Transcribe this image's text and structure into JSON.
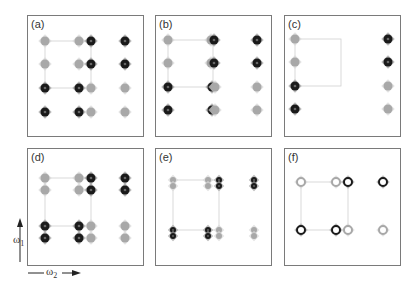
{
  "figure": {
    "panels": [
      {
        "id": "a",
        "label": "(a)",
        "box": [
          27,
          15,
          117,
          122
        ],
        "rect": [
          45,
          41,
          91,
          88
        ],
        "peaks": [
          {
            "x": 45,
            "y": 41,
            "t": "light"
          },
          {
            "x": 79,
            "y": 41,
            "t": "light"
          },
          {
            "x": 91,
            "y": 41,
            "t": "dark"
          },
          {
            "x": 125,
            "y": 41,
            "t": "dark"
          },
          {
            "x": 45,
            "y": 64,
            "t": "light"
          },
          {
            "x": 79,
            "y": 64,
            "t": "light"
          },
          {
            "x": 91,
            "y": 64,
            "t": "dark"
          },
          {
            "x": 125,
            "y": 64,
            "t": "dark"
          },
          {
            "x": 45,
            "y": 88,
            "t": "dark"
          },
          {
            "x": 79,
            "y": 88,
            "t": "dark"
          },
          {
            "x": 91,
            "y": 88,
            "t": "light"
          },
          {
            "x": 125,
            "y": 88,
            "t": "light"
          },
          {
            "x": 45,
            "y": 112,
            "t": "dark"
          },
          {
            "x": 79,
            "y": 112,
            "t": "dark"
          },
          {
            "x": 91,
            "y": 112,
            "t": "light"
          },
          {
            "x": 125,
            "y": 112,
            "t": "light"
          }
        ]
      },
      {
        "id": "b",
        "label": "(b)",
        "box": [
          155,
          15,
          117,
          122
        ],
        "rect": [
          168,
          40,
          213,
          87
        ],
        "peaks": [
          {
            "x": 168,
            "y": 40,
            "t": "light"
          },
          {
            "x": 211,
            "y": 40,
            "t": "light"
          },
          {
            "x": 214,
            "y": 40,
            "t": "dark"
          },
          {
            "x": 257,
            "y": 40,
            "t": "dark"
          },
          {
            "x": 168,
            "y": 63,
            "t": "light"
          },
          {
            "x": 211,
            "y": 63,
            "t": "light"
          },
          {
            "x": 214,
            "y": 63,
            "t": "dark"
          },
          {
            "x": 257,
            "y": 63,
            "t": "dark"
          },
          {
            "x": 168,
            "y": 87,
            "t": "dark"
          },
          {
            "x": 212,
            "y": 87,
            "t": "dark"
          },
          {
            "x": 215,
            "y": 87,
            "t": "light"
          },
          {
            "x": 257,
            "y": 87,
            "t": "light"
          },
          {
            "x": 168,
            "y": 110,
            "t": "dark"
          },
          {
            "x": 212,
            "y": 110,
            "t": "dark"
          },
          {
            "x": 215,
            "y": 110,
            "t": "light"
          },
          {
            "x": 257,
            "y": 110,
            "t": "light"
          }
        ]
      },
      {
        "id": "c",
        "label": "(c)",
        "box": [
          284,
          15,
          117,
          122
        ],
        "rect": [
          295,
          39,
          341,
          86
        ],
        "peaks": [
          {
            "x": 295,
            "y": 39,
            "t": "light"
          },
          {
            "x": 388,
            "y": 39,
            "t": "dark"
          },
          {
            "x": 295,
            "y": 62,
            "t": "light"
          },
          {
            "x": 388,
            "y": 62,
            "t": "dark"
          },
          {
            "x": 295,
            "y": 86,
            "t": "dark"
          },
          {
            "x": 388,
            "y": 86,
            "t": "light"
          },
          {
            "x": 295,
            "y": 109,
            "t": "dark"
          },
          {
            "x": 388,
            "y": 109,
            "t": "light"
          }
        ]
      },
      {
        "id": "d",
        "label": "(d)",
        "box": [
          27,
          148,
          117,
          118
        ],
        "rect": [
          45,
          178,
          91,
          226
        ],
        "peaks": [
          {
            "x": 45,
            "y": 178,
            "t": "light"
          },
          {
            "x": 79,
            "y": 178,
            "t": "light"
          },
          {
            "x": 91,
            "y": 178,
            "t": "dark"
          },
          {
            "x": 125,
            "y": 178,
            "t": "dark"
          },
          {
            "x": 45,
            "y": 190,
            "t": "light"
          },
          {
            "x": 79,
            "y": 190,
            "t": "light"
          },
          {
            "x": 91,
            "y": 190,
            "t": "dark"
          },
          {
            "x": 125,
            "y": 190,
            "t": "dark"
          },
          {
            "x": 45,
            "y": 226,
            "t": "dark"
          },
          {
            "x": 79,
            "y": 226,
            "t": "dark"
          },
          {
            "x": 91,
            "y": 226,
            "t": "light"
          },
          {
            "x": 125,
            "y": 226,
            "t": "light"
          },
          {
            "x": 45,
            "y": 238,
            "t": "dark"
          },
          {
            "x": 79,
            "y": 238,
            "t": "dark"
          },
          {
            "x": 91,
            "y": 238,
            "t": "light"
          },
          {
            "x": 125,
            "y": 238,
            "t": "light"
          }
        ]
      },
      {
        "id": "e",
        "label": "(e)",
        "box": [
          155,
          148,
          117,
          118
        ],
        "rect": [
          173,
          180,
          219,
          230
        ],
        "peaks": [
          {
            "x": 173,
            "y": 180,
            "t": "light",
            "s": "small"
          },
          {
            "x": 173,
            "y": 186,
            "t": "light",
            "s": "small"
          },
          {
            "x": 208,
            "y": 180,
            "t": "light",
            "s": "small"
          },
          {
            "x": 208,
            "y": 186,
            "t": "light",
            "s": "small"
          },
          {
            "x": 219,
            "y": 180,
            "t": "dark",
            "s": "small"
          },
          {
            "x": 219,
            "y": 186,
            "t": "dark",
            "s": "small"
          },
          {
            "x": 254,
            "y": 180,
            "t": "dark",
            "s": "small"
          },
          {
            "x": 254,
            "y": 186,
            "t": "dark",
            "s": "small"
          },
          {
            "x": 173,
            "y": 230,
            "t": "dark",
            "s": "small"
          },
          {
            "x": 173,
            "y": 236,
            "t": "dark",
            "s": "small"
          },
          {
            "x": 208,
            "y": 230,
            "t": "dark",
            "s": "small"
          },
          {
            "x": 208,
            "y": 236,
            "t": "dark",
            "s": "small"
          },
          {
            "x": 219,
            "y": 230,
            "t": "light",
            "s": "small"
          },
          {
            "x": 219,
            "y": 236,
            "t": "light",
            "s": "small"
          },
          {
            "x": 254,
            "y": 230,
            "t": "light",
            "s": "small"
          },
          {
            "x": 254,
            "y": 236,
            "t": "light",
            "s": "small"
          }
        ]
      },
      {
        "id": "f",
        "label": "(f)",
        "box": [
          284,
          148,
          117,
          118
        ],
        "rect": [
          301,
          182,
          348,
          230
        ],
        "peaks": [
          {
            "x": 301,
            "y": 182,
            "t": "light",
            "s": "ring"
          },
          {
            "x": 336,
            "y": 182,
            "t": "light",
            "s": "ring"
          },
          {
            "x": 348,
            "y": 182,
            "t": "dark",
            "s": "ring"
          },
          {
            "x": 383,
            "y": 182,
            "t": "dark",
            "s": "ring"
          },
          {
            "x": 301,
            "y": 230,
            "t": "dark",
            "s": "ring"
          },
          {
            "x": 336,
            "y": 230,
            "t": "dark",
            "s": "ring"
          },
          {
            "x": 348,
            "y": 230,
            "t": "light",
            "s": "ring"
          },
          {
            "x": 383,
            "y": 230,
            "t": "light",
            "s": "ring"
          }
        ]
      }
    ],
    "axes": {
      "vertical": {
        "symbol": "ω",
        "subscript": "1"
      },
      "horizontal": {
        "symbol": "ω",
        "subscript": "2"
      }
    },
    "colors": {
      "border": "#7a7a7a",
      "dark_peak": "#1a1a1a",
      "light_peak": "#a8a8a8",
      "connector": "#d0d0d0"
    }
  }
}
